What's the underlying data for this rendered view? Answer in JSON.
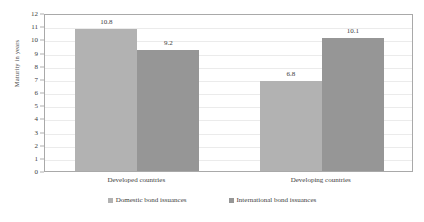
{
  "chart_data": {
    "type": "bar",
    "title": "",
    "xlabel": "",
    "ylabel": "Maturity in years",
    "ylim": [
      0,
      12
    ],
    "ytick_labels": [
      "12",
      "11",
      "10",
      "9",
      "8",
      "7",
      "6",
      "5",
      "4",
      "3",
      "2",
      "1",
      "0"
    ],
    "grid": true,
    "legend_position": "bottom",
    "categories": [
      "Developed countries",
      "Developing countries"
    ],
    "series": [
      {
        "name": "Domestic bond issuances",
        "color": "#b2b2b2",
        "values": [
          10.8,
          6.8
        ],
        "value_labels": [
          "10.8",
          "6.8"
        ]
      },
      {
        "name": "International bond issuances",
        "color": "#969696",
        "values": [
          9.2,
          10.1
        ],
        "value_labels": [
          "9.2",
          "10.1"
        ]
      }
    ]
  }
}
